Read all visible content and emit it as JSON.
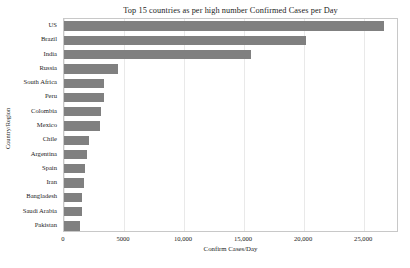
{
  "chart_data": {
    "type": "bar",
    "orientation": "horizontal",
    "title": "Top 15 countries as per high number Confirmed Cases per Day",
    "xlabel": "Confirm Cases/Day",
    "ylabel": "Country/Region",
    "categories": [
      "US",
      "Brazil",
      "India",
      "Russia",
      "South Africa",
      "Peru",
      "Colombia",
      "Mexico",
      "Chile",
      "Argentina",
      "Spain",
      "Iran",
      "Bangladesh",
      "Saudi Arabia",
      "Pakistan"
    ],
    "values": [
      26650,
      20150,
      15580,
      4500,
      3350,
      3330,
      3100,
      3000,
      2100,
      1900,
      1750,
      1700,
      1520,
      1500,
      1330
    ],
    "xlim": [
      0,
      27900
    ],
    "ylim": [
      -0.5,
      14.5
    ],
    "xticks": [
      0,
      5000,
      10000,
      15000,
      20000,
      25000
    ],
    "xtick_labels": [
      "0",
      "5000",
      "10,000",
      "15,000",
      "20,000",
      "25,000"
    ],
    "grid": "vertical-only",
    "legend": null,
    "bar_color": "#808080",
    "grid_color": "#e9e9e9",
    "frame_color": "#c8c8c8",
    "background": "#ffffff"
  }
}
